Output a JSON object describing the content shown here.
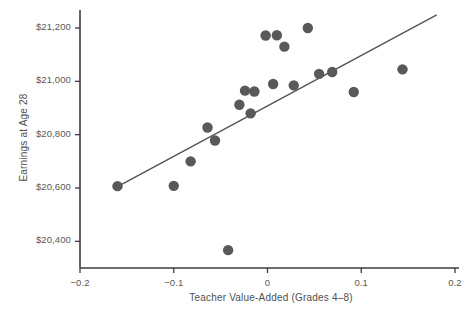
{
  "chart_data": {
    "type": "scatter",
    "title": "",
    "xlabel": "Teacher Value-Added (Grades 4–8)",
    "ylabel": "Earnings at Age 28",
    "xlim": [
      -0.2,
      0.2
    ],
    "ylim": [
      20300,
      21260
    ],
    "xticks": [
      -0.2,
      -0.1,
      0,
      0.1,
      0.2
    ],
    "xticklabels": [
      "−0.2",
      "−0.1",
      "0",
      "0.1",
      "0.2"
    ],
    "yticks": [
      20400,
      20600,
      20800,
      21000,
      21200
    ],
    "yticklabels": [
      "$20,400",
      "$20,600",
      "$20,800",
      "$21,000",
      "$21,200"
    ],
    "grid": false,
    "legend": null,
    "marker_color": "#595959",
    "marker_size": 5.2,
    "line_color": "#555555",
    "axis_color": "#3d3d3d",
    "points": [
      {
        "x": -0.16,
        "y": 20607
      },
      {
        "x": -0.1,
        "y": 20608
      },
      {
        "x": -0.082,
        "y": 20700
      },
      {
        "x": -0.064,
        "y": 20827
      },
      {
        "x": -0.056,
        "y": 20778
      },
      {
        "x": -0.042,
        "y": 20367
      },
      {
        "x": -0.03,
        "y": 20912
      },
      {
        "x": -0.024,
        "y": 20965
      },
      {
        "x": -0.018,
        "y": 20880
      },
      {
        "x": -0.014,
        "y": 20962
      },
      {
        "x": -0.002,
        "y": 21172
      },
      {
        "x": 0.006,
        "y": 20990
      },
      {
        "x": 0.01,
        "y": 21173
      },
      {
        "x": 0.018,
        "y": 21130
      },
      {
        "x": 0.028,
        "y": 20985
      },
      {
        "x": 0.043,
        "y": 21200
      },
      {
        "x": 0.055,
        "y": 21028
      },
      {
        "x": 0.069,
        "y": 21035
      },
      {
        "x": 0.092,
        "y": 20960
      },
      {
        "x": 0.144,
        "y": 21045
      }
    ],
    "fit_line": {
      "x_start": -0.16,
      "y_start": 20605,
      "x_end": 0.18,
      "y_end": 21248
    }
  }
}
